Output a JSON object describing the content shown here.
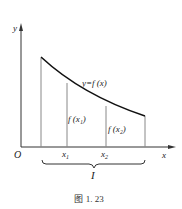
{
  "figure": {
    "caption": "图 1. 23",
    "axes": {
      "x_label": "x",
      "y_label": "y",
      "origin_label": "O"
    },
    "curve_label": "y=f (x)",
    "points": [
      {
        "name": "x1",
        "base": "x",
        "sub": "1",
        "value_label": "f (x₁)"
      },
      {
        "name": "x2",
        "base": "x",
        "sub": "2",
        "value_label": "f (x₂)"
      }
    ],
    "interval_label": "I",
    "colors": {
      "axis": "#333333",
      "curve": "#111111",
      "ordinates": "#888888"
    }
  }
}
